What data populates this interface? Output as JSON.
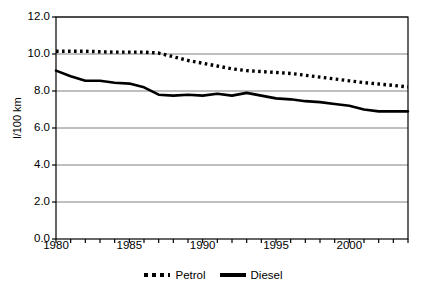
{
  "chart_data": {
    "type": "line",
    "title": "",
    "xlabel": "",
    "ylabel": "l/100 km",
    "xlim": [
      1980,
      2004
    ],
    "ylim": [
      0.0,
      12.0
    ],
    "ytick_step": 2.0,
    "grid": true,
    "legend_position": "bottom",
    "ytick_labels": [
      "12.0",
      "10.0",
      "8.0",
      "6.0",
      "4.0",
      "2.0",
      "0.0"
    ],
    "ytick_values": [
      12.0,
      10.0,
      8.0,
      6.0,
      4.0,
      2.0,
      0.0
    ],
    "xtick_labels": [
      "1980",
      "1985",
      "1990",
      "1995",
      "2000"
    ],
    "xtick_values": [
      1980,
      1985,
      1990,
      1995,
      2000
    ],
    "x": [
      1980,
      1981,
      1982,
      1983,
      1984,
      1985,
      1986,
      1987,
      1988,
      1989,
      1990,
      1991,
      1992,
      1993,
      1994,
      1995,
      1996,
      1997,
      1998,
      1999,
      2000,
      2001,
      2002,
      2003,
      2004
    ],
    "series": [
      {
        "name": "Petrol",
        "style": "dotted",
        "color": "#000000",
        "values": [
          10.15,
          10.15,
          10.15,
          10.12,
          10.1,
          10.1,
          10.1,
          10.05,
          9.85,
          9.65,
          9.5,
          9.35,
          9.2,
          9.1,
          9.05,
          9.0,
          8.95,
          8.85,
          8.75,
          8.65,
          8.55,
          8.45,
          8.38,
          8.3,
          8.22
        ]
      },
      {
        "name": "Diesel",
        "style": "solid",
        "color": "#000000",
        "values": [
          9.1,
          8.8,
          8.55,
          8.55,
          8.45,
          8.4,
          8.2,
          7.8,
          7.75,
          7.8,
          7.75,
          7.85,
          7.75,
          7.9,
          7.75,
          7.6,
          7.55,
          7.45,
          7.4,
          7.3,
          7.2,
          7.0,
          6.9,
          6.9,
          6.9
        ]
      }
    ],
    "legend": [
      {
        "label": "Petrol",
        "style": "dotted"
      },
      {
        "label": "Diesel",
        "style": "solid"
      }
    ]
  }
}
